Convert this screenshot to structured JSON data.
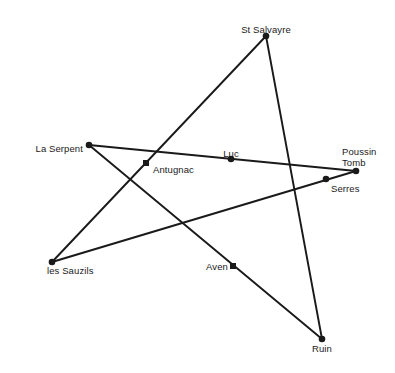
{
  "diagram": {
    "background_color": "#ffffff",
    "line_color": "#1a1a1a",
    "marker_color": "#1a1a1a",
    "text_color": "#1a1a1a",
    "width": 395,
    "height": 373
  },
  "chart_data": {
    "type": "scatter",
    "title": "",
    "xlabel": "",
    "ylabel": "",
    "grid": false,
    "legend": "none",
    "xlim": [
      0,
      395
    ],
    "ylim": [
      0,
      373
    ],
    "points": [
      {
        "label": "St Salvayre",
        "x": 266,
        "y": 36,
        "marker": "dot",
        "label_x": 266,
        "label_y": 25,
        "label_align": "center"
      },
      {
        "label": "La Serpent",
        "x": 89,
        "y": 145,
        "marker": "dot",
        "label_x": 83,
        "label_y": 144,
        "label_align": "right"
      },
      {
        "label": "Antugnac",
        "x": 146,
        "y": 163,
        "marker": "square",
        "label_x": 153,
        "label_y": 165,
        "label_align": "left"
      },
      {
        "label": "Luc",
        "x": 231,
        "y": 159,
        "marker": "dot",
        "label_x": 231,
        "label_y": 149,
        "label_align": "center"
      },
      {
        "label": "Poussin\nTomb",
        "x": 356,
        "y": 171,
        "marker": "dot",
        "label_x": 342,
        "label_y": 147,
        "label_align": "left"
      },
      {
        "label": "Serres",
        "x": 326,
        "y": 179,
        "marker": "dot",
        "label_x": 331,
        "label_y": 184,
        "label_align": "left"
      },
      {
        "label": "les Sauzils",
        "x": 52,
        "y": 262,
        "marker": "dot",
        "label_x": 47,
        "label_y": 266,
        "label_align": "left"
      },
      {
        "label": "Aven",
        "x": 233,
        "y": 266,
        "marker": "square",
        "label_x": 228,
        "label_y": 262,
        "label_align": "right"
      },
      {
        "label": "Ruin",
        "x": 322,
        "y": 339,
        "marker": "dot",
        "label_x": 322,
        "label_y": 344,
        "label_align": "center"
      }
    ],
    "lines": [
      {
        "name": "la-serpent-to-poussin-tomb",
        "from": "La Serpent",
        "to": "Poussin Tomb",
        "x1": 89,
        "y1": 145,
        "x2": 356,
        "y2": 171,
        "through": [
          "Antugnac",
          "Luc"
        ]
      },
      {
        "name": "st-salvayre-to-les-sauzils",
        "from": "St Salvayre",
        "to": "les Sauzils",
        "x1": 266,
        "y1": 36,
        "x2": 52,
        "y2": 262,
        "through": [
          "Antugnac"
        ]
      },
      {
        "name": "st-salvayre-to-ruin",
        "from": "St Salvayre",
        "to": "Ruin",
        "x1": 266,
        "y1": 36,
        "x2": 322,
        "y2": 339,
        "through": []
      },
      {
        "name": "les-sauzils-to-poussin-tomb",
        "from": "les Sauzils",
        "to": "Poussin Tomb",
        "x1": 52,
        "y1": 262,
        "x2": 356,
        "y2": 171,
        "through": [
          "Serres"
        ]
      },
      {
        "name": "la-serpent-to-ruin",
        "from": "La Serpent",
        "to": "Ruin",
        "x1": 89,
        "y1": 145,
        "x2": 322,
        "y2": 339,
        "through": [
          "Aven"
        ]
      }
    ]
  }
}
